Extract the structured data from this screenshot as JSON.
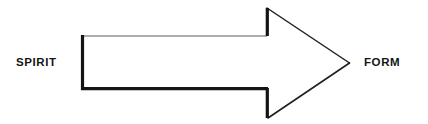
{
  "canvas": {
    "width": 428,
    "height": 124,
    "background_color": "#ffffff"
  },
  "diagram": {
    "type": "arrow-diagram",
    "direction": "left-to-right",
    "labels": {
      "left": "SPIRIT",
      "right": "FORM"
    },
    "arrow": {
      "name": "block-arrow-right",
      "fill_color": "#ffffff",
      "outline_color": "#1c1c1c",
      "outline_light_color": "#5a5a5a",
      "thick_stroke_width": 3,
      "thin_stroke_width": 1,
      "shaft": {
        "left": 81,
        "right": 267,
        "top": 36,
        "bottom": 90
      },
      "head": {
        "barb_top": 8,
        "barb_bottom": 118,
        "base_x": 267,
        "tip_x": 349,
        "tip_y": 63
      }
    }
  }
}
